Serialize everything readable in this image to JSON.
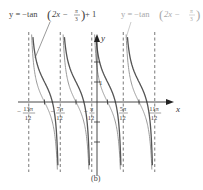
{
  "chart_data": {
    "type": "line",
    "title": "",
    "caption": "(b)",
    "xlabel": "x",
    "ylabel": "y",
    "grid": false,
    "series": [
      {
        "name": "y = −tan(2x − π/3) + 1",
        "label_parts": {
          "lhs": "y = −tan",
          "arg": "2x − ",
          "num": "π",
          "den": "3",
          "tail": " + 1"
        },
        "color": "#555555",
        "style": "solid-dark"
      },
      {
        "name": "y = −tan(2x − π/3)",
        "label_parts": {
          "lhs": "y = −tan",
          "arg": "2x − ",
          "num": "π",
          "den": "3",
          "tail": ""
        },
        "color": "#9a9a9a",
        "style": "solid-light"
      }
    ],
    "asymptotes": [
      {
        "x": "-13π/12",
        "num": "13π",
        "den": "12",
        "sign": "−"
      },
      {
        "x": "-7π/12",
        "num": "7π",
        "den": "12",
        "sign": "−"
      },
      {
        "x": "-π/12",
        "num": "π",
        "den": "12",
        "sign": "−"
      },
      {
        "x": "5π/12",
        "num": "5π",
        "den": "12",
        "sign": ""
      },
      {
        "x": "11π/12",
        "num": "11π",
        "den": "12",
        "sign": ""
      }
    ],
    "y_ticks": [
      {
        "value": 1,
        "label": "1"
      }
    ],
    "period": "π/2",
    "xlim": [
      "-13π/12",
      "11π/12"
    ],
    "ylim": [
      -3,
      3
    ]
  }
}
